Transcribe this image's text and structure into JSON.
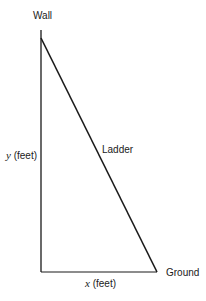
{
  "diagram": {
    "labels": {
      "wall": "Wall",
      "ladder": "Ladder",
      "ground": "Ground",
      "y_axis_var": "y",
      "y_axis_unit": "(feet)",
      "x_axis_var": "x",
      "x_axis_unit": "(feet)"
    },
    "geometry": {
      "wall_top": [
        41,
        30
      ],
      "corner": [
        41,
        272
      ],
      "ladder_foot": [
        157,
        272
      ]
    },
    "colors": {
      "line": "#1a1a1a",
      "background": "#ffffff"
    }
  }
}
